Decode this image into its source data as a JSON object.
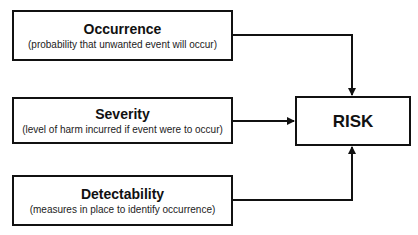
{
  "factors": [
    {
      "title": "Occurrence",
      "description": "(probability that unwanted event will occur)"
    },
    {
      "title": "Severity",
      "description": "(level of harm incurred if event were to occur)"
    },
    {
      "title": "Detectability",
      "description": "(measures in place to identify occurrence)"
    }
  ],
  "result": {
    "title": "RISK"
  },
  "colors": {
    "stroke": "#111111",
    "background": "#ffffff"
  }
}
